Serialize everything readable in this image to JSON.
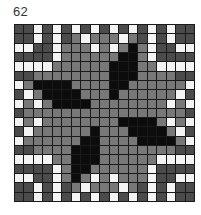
{
  "label": "62",
  "grid": {
    "rows": 19,
    "cols": 19,
    "legend": {
      "W": "white",
      "D": "dark-gray",
      "L": "mid-gray",
      "B": "black"
    },
    "colors": {
      "W": "#f4f4f4",
      "D": "#4b4b4b",
      "L": "#787878",
      "B": "#0c0c0c",
      "line": "#1a1a1a"
    },
    "cells": [
      "DDWDWDWDWDWDWDWDWDD",
      "DDWDWDLWLLLWLDWDWDD",
      "WWDDWLLLWLWLBLWDDWW",
      "DDDDWLLLLLLBBLWDDDD",
      "WWWWLLLLLLBBBLLWWWW",
      "DDLLLLLLLLBBBLLLLDD",
      "WLBBBBLLLLBBLLLLLLW",
      "DWLBBBBLLLBLLLLLLWD",
      "WLWLBBBBLLLLLLLLWLW",
      "DLLLLLLLLLLLLLLLLLD",
      "WLWLLLLLLLLBBBBLWLW",
      "DWLLLLLLBLLLBBBBLWD",
      "WLLLLLLBBLLLLBBBBLW",
      "DDLLLLBBBLLLLLLLLDD",
      "WWWWLLBBBLLLLLLWWWW",
      "DDDDWLBBLLLLLLWDDDD",
      "WWDDWLBLWLWLLLWDDWW",
      "DDWDWDLWLLLWLDWDWDD",
      "DDWDWDWDWDWDWDWDWDD"
    ]
  }
}
